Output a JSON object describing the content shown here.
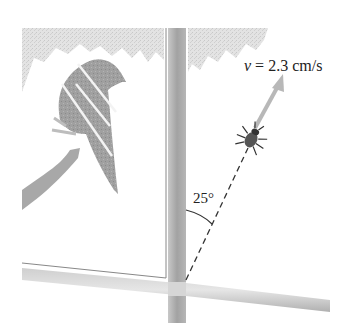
{
  "figure": {
    "velocity_label": {
      "variable": "v",
      "equals": " = 2.3 cm/s",
      "value": 2.3,
      "unit": "cm/s"
    },
    "angle_label": "25°",
    "angle_degrees": 25,
    "colors": {
      "frame_light": "#d8d8d8",
      "frame_dark": "#a9a9a9",
      "foliage": "#dcdcdc",
      "bird": "#9a9a9a",
      "arrow": "#b8b8b8",
      "ink": "#222222"
    }
  }
}
